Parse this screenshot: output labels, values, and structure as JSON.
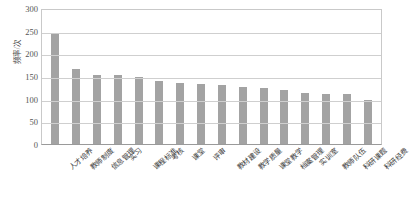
{
  "chart_data": {
    "type": "bar",
    "title": "",
    "xlabel": "",
    "ylabel": "频率/次",
    "ylim": [
      0,
      300
    ],
    "yticks": [
      300,
      250,
      200,
      150,
      100,
      50,
      0
    ],
    "grid": true,
    "legend": "none",
    "bar_color": "#a3a3a3",
    "categories": [
      "人才培养",
      "教师制度",
      "信息管理",
      "实习",
      "课程标准",
      "考核",
      "课堂",
      "评审",
      "教材建设",
      "教学质量",
      "课堂教学",
      "档案管理",
      "实训室",
      "教师队伍",
      "科研课题",
      "科研经费"
    ],
    "values": [
      245,
      165,
      152,
      152,
      147,
      140,
      135,
      133,
      131,
      126,
      124,
      120,
      113,
      110,
      110,
      98
    ]
  }
}
